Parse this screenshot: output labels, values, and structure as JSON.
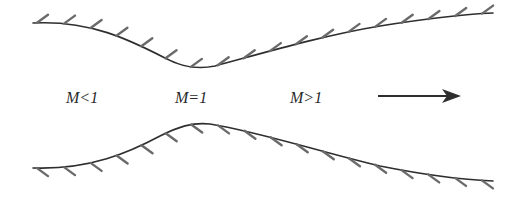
{
  "diagram": {
    "labels": {
      "subsonic": "M<1",
      "sonic": "M=1",
      "supersonic": "M>1"
    },
    "flow_direction": "left-to-right",
    "colors": {
      "wall": "#2e2e2e",
      "hatch": "#6a6a6a",
      "text": "#2a2a2a",
      "background": "#ffffff"
    }
  }
}
